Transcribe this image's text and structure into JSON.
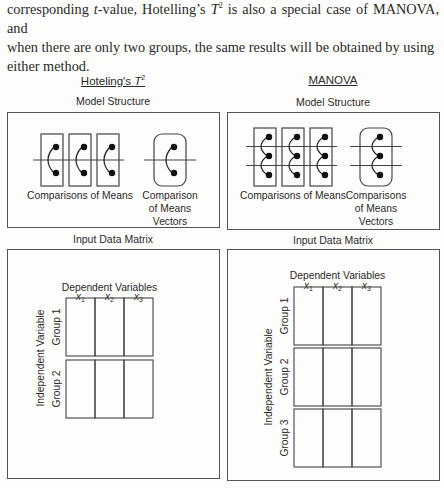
{
  "intro": {
    "line1_prefix": "corresponding ",
    "line1_italic": "t",
    "line1_mid": "-value, Hotelling’s ",
    "line1_T": "T",
    "line1_sup": "2",
    "line1_suffix": " is also a special case of MANOVA, and",
    "line2": "when there are only two groups, the same results will be obtained by using",
    "line3": "either method."
  },
  "hotelling": {
    "title": "Hoteling's ",
    "title_T": "T",
    "title_sup": "2",
    "model_structure_label": "Model Structure",
    "comparisons_label": "Comparisons of Means",
    "vector_label_lines": [
      "Comparison",
      "of Means",
      "Vectors"
    ],
    "input_matrix_label": "Input Data Matrix",
    "dependent_label": "Dependent Variables",
    "independent_label": "Independent Variable",
    "variables": [
      {
        "name": "x",
        "sub": "1"
      },
      {
        "name": "x",
        "sub": "2"
      },
      {
        "name": "x",
        "sub": "3"
      }
    ],
    "groups": [
      "Group 1",
      "Group 2"
    ],
    "dots_per_box": 2
  },
  "manova": {
    "title": "MANOVA",
    "model_structure_label": "Model Structure",
    "comparisons_label": "Comparisons of Means",
    "vector_label_lines": [
      "Comparisons",
      "of Means",
      "Vectors"
    ],
    "input_matrix_label": "Input Data Matrix",
    "dependent_label": "Dependent Variables",
    "independent_label": "Independent Variable",
    "variables": [
      {
        "name": "x",
        "sub": "1"
      },
      {
        "name": "x",
        "sub": "2"
      },
      {
        "name": "x",
        "sub": "3"
      }
    ],
    "groups": [
      "Group 1",
      "Group 2",
      "Group 3"
    ],
    "dots_per_box": 3
  }
}
